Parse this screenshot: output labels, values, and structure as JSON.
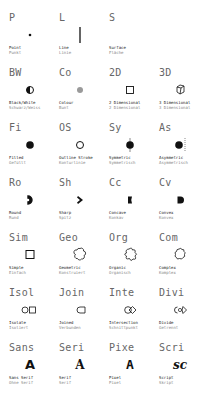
{
  "rows": [
    {
      "cells": [
        {
          "code": "P",
          "label_en": "Point",
          "label_de": "Punkt",
          "icon": "point-icon"
        },
        {
          "code": "L",
          "label_en": "Line",
          "label_de": "Linie",
          "icon": "line-icon"
        },
        {
          "code": "S",
          "label_en": "Surface",
          "label_de": "Fläche",
          "icon": "surface-icon"
        }
      ]
    },
    {
      "cells": [
        {
          "code": "BW",
          "label_en": "Black/White",
          "label_de": "Schwarz/Weiss",
          "icon": "half-circle-icon"
        },
        {
          "code": "Co",
          "label_en": "Colour",
          "label_de": "Bunt",
          "icon": "grey-dot-icon"
        },
        {
          "code": "2D",
          "label_en": "2 Dimensional",
          "label_de": "2 Dimensional",
          "icon": "square-icon"
        },
        {
          "code": "3D",
          "label_en": "3 Dimensional",
          "label_de": "3 Dimensional",
          "icon": "cube-icon"
        }
      ]
    },
    {
      "cells": [
        {
          "code": "Fi",
          "label_en": "Filled",
          "label_de": "Gefüllt",
          "icon": "filled-circle-icon"
        },
        {
          "code": "OS",
          "label_en": "Outline Stroke",
          "label_de": "Konturlinie",
          "icon": "outline-circle-icon"
        },
        {
          "code": "Sy",
          "label_en": "Symmetric",
          "label_de": "Symmetrisch",
          "icon": "symmetric-icon"
        },
        {
          "code": "As",
          "label_en": "Asymmetric",
          "label_de": "Asymmetrisch",
          "icon": "asymmetric-icon"
        }
      ]
    },
    {
      "cells": [
        {
          "code": "Ro",
          "label_en": "Round",
          "label_de": "Rund",
          "icon": "round-icon"
        },
        {
          "code": "Sh",
          "label_en": "Sharp",
          "label_de": "Spitz",
          "icon": "sharp-icon"
        },
        {
          "code": "Cc",
          "label_en": "Concave",
          "label_de": "Konkav",
          "icon": "concave-icon"
        },
        {
          "code": "Cv",
          "label_en": "Convex",
          "label_de": "Konvex",
          "icon": "convex-icon"
        }
      ]
    },
    {
      "cells": [
        {
          "code": "Sim",
          "label_en": "Simple",
          "label_de": "Einfach",
          "icon": "simple-square-icon"
        },
        {
          "code": "Geo",
          "label_en": "Geometric",
          "label_de": "Konstruiert",
          "icon": "geometric-flower-icon"
        },
        {
          "code": "Org",
          "label_en": "Organic",
          "label_de": "Organisch",
          "icon": "organic-blob-icon"
        },
        {
          "code": "Com",
          "label_en": "Complex",
          "label_de": "Komplex",
          "icon": "complex-cloud-icon"
        }
      ]
    },
    {
      "cells": [
        {
          "code": "Isol",
          "label_en": "Isolate",
          "label_de": "Isoliert",
          "icon": "isolate-icon"
        },
        {
          "code": "Join",
          "label_en": "Joined",
          "label_de": "Verbunden",
          "icon": "joined-icon"
        },
        {
          "code": "Inte",
          "label_en": "Intersection",
          "label_de": "Schnittpunkt",
          "icon": "intersection-icon"
        },
        {
          "code": "Divi",
          "label_en": "Divide",
          "label_de": "Getrennt",
          "icon": "divide-icon"
        }
      ]
    },
    {
      "cells": [
        {
          "code": "Sans",
          "label_en": "Sans Serif",
          "label_de": "Ohne Serif",
          "icon": "sans-serif-glyph-icon",
          "glyph": "A"
        },
        {
          "code": "Seri",
          "label_en": "Serif",
          "label_de": "Serif",
          "icon": "serif-glyph-icon",
          "glyph": "A"
        },
        {
          "code": "Pixe",
          "label_en": "Pixel",
          "label_de": "Pixel",
          "icon": "pixel-glyph-icon",
          "glyph": "A"
        },
        {
          "code": "Scri",
          "label_en": "Script",
          "label_de": "Skript",
          "icon": "script-glyph-icon",
          "glyph": "sc"
        }
      ]
    }
  ]
}
